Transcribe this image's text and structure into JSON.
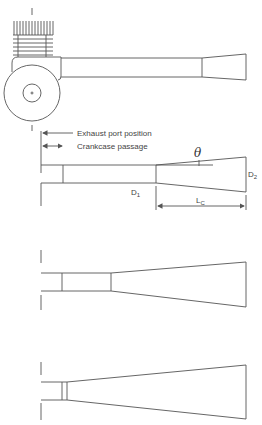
{
  "diagram": {
    "labels": {
      "exhaust_port_position": "Exhaust port position",
      "crankcase_passage": "Crankcase passage",
      "theta": "θ",
      "d1_main": "D",
      "d1_sub": "1",
      "d2_main": "D",
      "d2_sub": "2",
      "lc_main": "L",
      "lc_sub": "C"
    },
    "panels": [
      {
        "name": "engine-with-exhaust-pipe",
        "description": "Cylinder with cooling fins, crankcase circle, straight pipe with short diffuser"
      },
      {
        "name": "dimensioned-diffuser",
        "description": "Pipe with diffuser showing D1, D2, Lc and cone angle theta"
      },
      {
        "name": "medium-diffuser",
        "description": "Shorter straight section, longer diffuser"
      },
      {
        "name": "long-diffuser",
        "description": "Very short straight section, longest diffuser"
      }
    ],
    "colors": {
      "line": "#555555",
      "text": "#444444",
      "background": "#ffffff"
    }
  }
}
